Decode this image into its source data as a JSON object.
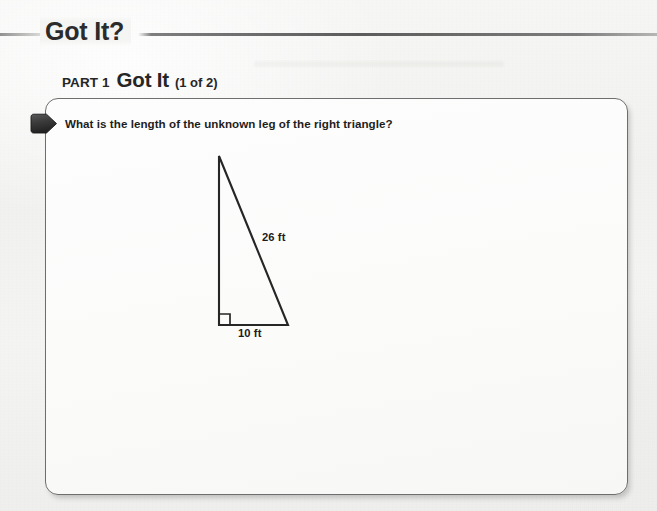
{
  "header": {
    "title": "Got It?",
    "rule": "horizontal-rule"
  },
  "part": {
    "label": "PART 1",
    "title": "Got It",
    "count": "(1 of 2)"
  },
  "card": {
    "marker": "pentagon-bullet-marker",
    "question": "What is the length of the unknown leg of the right triangle?"
  },
  "figure": {
    "name": "right-triangle-diagram",
    "hypotenuse_label": "26 ft",
    "base_label": "10 ft",
    "right_angle_marker": "right-angle-square",
    "unknown_side": "vertical-leg",
    "stroke_color": "#262626"
  },
  "colors": {
    "page_background": "#f2f2f1",
    "card_background": "#fbfbfa",
    "card_border": "#6e6e6e",
    "text": "#1e1e1e",
    "heading": "#2b2b2b",
    "marker": "#3a3a3a"
  }
}
